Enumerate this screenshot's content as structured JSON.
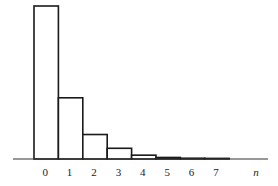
{
  "chart_data": {
    "type": "bar",
    "title": "",
    "xlabel": "n",
    "ylabel": "",
    "categories": [
      "0",
      "1",
      "2",
      "3",
      "4",
      "5",
      "6",
      "7"
    ],
    "values": [
      1.0,
      0.4,
      0.16,
      0.07,
      0.025,
      0.01,
      0.005,
      0.002
    ],
    "ylim": [
      0,
      1.0
    ],
    "grid": false,
    "legend": null,
    "bar_style": "outlined, adjacent (histogram)"
  },
  "layout": {
    "axis_y": 159,
    "axis_x_start": 13,
    "axis_x_end": 268,
    "bar_x0": 34,
    "bar_width": 24.4,
    "max_height": 153,
    "label_y": 176,
    "xlabel_x": 256
  }
}
